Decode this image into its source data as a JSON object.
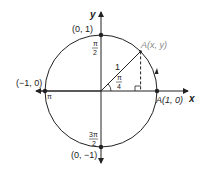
{
  "diagram": {
    "type": "unit-circle",
    "axes": {
      "x_label": "x",
      "y_label": "y"
    },
    "points": {
      "top": {
        "label": "(0, 1)",
        "angle_num": "π",
        "angle_den": "2"
      },
      "left": {
        "label": "(−1, 0)",
        "angle": "π"
      },
      "bottom": {
        "label": "(0, −1)",
        "angle_num": "3π",
        "angle_den": "2"
      },
      "right": {
        "label": "A(1, 0)"
      },
      "moving": {
        "label": "A(x, y)"
      }
    },
    "radius_label": "1",
    "angle": {
      "num": "π",
      "den": "4"
    },
    "colors": {
      "stroke": "#222222",
      "label_gray": "#888888"
    }
  }
}
